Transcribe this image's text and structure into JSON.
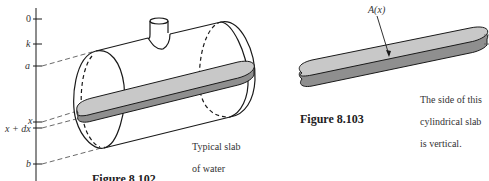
{
  "figure_102": {
    "axis_labels": {
      "zero": "0",
      "k": "k",
      "a": "a",
      "x": "x",
      "x_dx": "x + dx",
      "b": "b"
    },
    "slab_note_line1": "Typical slab",
    "slab_note_line2": "of water",
    "caption": "Figure 8.102"
  },
  "figure_103": {
    "area_label": "A(x)",
    "note_line1": "The side of this",
    "note_line2": "cylindrical slab",
    "note_line3": "is vertical.",
    "caption": "Figure 8.103"
  },
  "colors": {
    "line": "#1a1a1a",
    "slab_fill": "#c8c8c8",
    "slab_side": "#8f8f8f",
    "dashed": "#444444"
  }
}
